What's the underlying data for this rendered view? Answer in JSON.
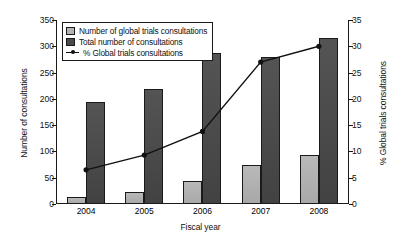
{
  "chart_data": {
    "type": "bar",
    "title": "",
    "xlabel": "Fiscal year",
    "ylabel": "Number of consultations",
    "ylabel_right": "% Global trials consultations",
    "categories": [
      "2004",
      "2005",
      "2006",
      "2007",
      "2008"
    ],
    "ylim": [
      0,
      350
    ],
    "ylim_right": [
      0,
      35
    ],
    "yticks": [
      0,
      50,
      100,
      150,
      200,
      250,
      300,
      350
    ],
    "yticks_right": [
      0,
      5,
      10,
      15,
      20,
      25,
      30,
      35
    ],
    "grid": false,
    "legend_position": "top-left",
    "series": [
      {
        "name": "Number of global trials consultations",
        "type": "bar",
        "axis": "left",
        "color": "#b0b0b0",
        "values": [
          13,
          22,
          43,
          75,
          93
        ]
      },
      {
        "name": "Total number of consultations",
        "type": "bar",
        "axis": "left",
        "color": "#4a4a4a",
        "values": [
          195,
          218,
          288,
          280,
          315
        ]
      },
      {
        "name": "% Global trials consultations",
        "type": "line",
        "axis": "right",
        "color": "#111111",
        "values": [
          6.5,
          9.3,
          13.8,
          27.0,
          30.0
        ]
      }
    ]
  },
  "legend": {
    "items": [
      {
        "label": "Number of global trials consultations",
        "marker": "square-light"
      },
      {
        "label": "Total number of consultations",
        "marker": "square-dark"
      },
      {
        "label": "% Global trials consultations",
        "marker": "line-dot"
      }
    ]
  }
}
